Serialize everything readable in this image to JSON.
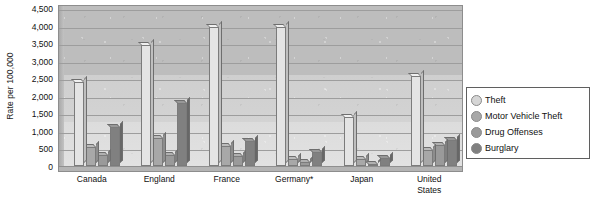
{
  "chart_data": {
    "type": "bar",
    "title": "",
    "subtitle": "",
    "xlabel": "",
    "ylabel": "Rate per 100,000",
    "ylim": [
      0,
      4500
    ],
    "ytick_step": 500,
    "ytick_labels": [
      "4,500",
      "4,000",
      "3,500",
      "3,000",
      "2,500",
      "2,000",
      "1,500",
      "1,000",
      "500",
      "0"
    ],
    "ytick_values": [
      4500,
      4000,
      3500,
      3000,
      2500,
      2000,
      1500,
      1000,
      500,
      0
    ],
    "grid": true,
    "grid_axis": "y",
    "legend_position": "right",
    "categories": [
      "Canada",
      "England",
      "France",
      "Germany*",
      "Japan",
      "United States"
    ],
    "series": [
      {
        "name": "Theft",
        "color": "#e4e4e4",
        "values": [
          2400,
          3450,
          3950,
          3950,
          1400,
          2550
        ]
      },
      {
        "name": "Motor Vehicle Theft",
        "color": "#a8a8a8",
        "values": [
          550,
          800,
          560,
          200,
          200,
          450
        ]
      },
      {
        "name": "Drug Offenses",
        "color": "#9a9a9a",
        "values": [
          300,
          300,
          280,
          120,
          50,
          600
        ]
      },
      {
        "name": "Burglary",
        "color": "#808080",
        "values": [
          1100,
          1800,
          700,
          400,
          230,
          730
        ]
      }
    ],
    "footnote": "*",
    "plot_background": "#cfcfcf",
    "gridline_color": "#9d9d9d"
  },
  "legend": {
    "items": [
      {
        "label": "Theft",
        "swatch": "legend-swatch-theft"
      },
      {
        "label": "Motor Vehicle Theft",
        "swatch": "legend-swatch-motor-vehicle-theft"
      },
      {
        "label": "Drug Offenses",
        "swatch": "legend-swatch-drug-offenses"
      },
      {
        "label": "Burglary",
        "swatch": "legend-swatch-burglary"
      }
    ]
  }
}
